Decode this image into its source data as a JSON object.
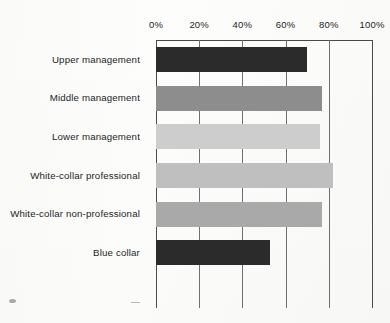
{
  "chart_data": {
    "type": "bar",
    "orientation": "horizontal",
    "title": "",
    "subtitle": "",
    "xlabel": "",
    "ylabel": "",
    "xlim": [
      0,
      100
    ],
    "grid": true,
    "grid_axis": "x",
    "legend": false,
    "axis_position": "top",
    "tick_labels": [
      "0%",
      "20%",
      "40%",
      "60%",
      "80%",
      "100%"
    ],
    "ticks": [
      0,
      20,
      40,
      60,
      80,
      100
    ],
    "categories": [
      "Upper management",
      "Middle management",
      "Lower management",
      "White-collar professional",
      "White-collar non-professional",
      "Blue collar"
    ],
    "values": [
      70,
      77,
      76,
      82,
      77,
      53
    ],
    "bar_colors": [
      "#2b2b2b",
      "#8d8d8d",
      "#cdcdcd",
      "#bfbfbf",
      "#a9a9a9",
      "#2b2b2b"
    ]
  },
  "style": {
    "background": "#fdfdfc",
    "gridline_color": "#6f6f6f",
    "frame_color": "#4a4a4a",
    "text_color": "#1d1d1d"
  }
}
